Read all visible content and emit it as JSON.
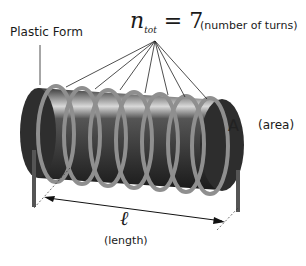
{
  "labels": {
    "form": "Plastic Form",
    "n_symbol": "n",
    "n_subscript": "tot",
    "n_equals": " = 7",
    "turns_note": "(number of turns)",
    "area_symbol": "A",
    "area_note": "(area)",
    "length_symbol": "ℓ",
    "length_note": "(length)"
  },
  "diagram": {
    "turns": 7,
    "colors": {
      "form": "#2a2a2a",
      "wire": "#8a8a8a",
      "lines": "#1a1a1a"
    }
  }
}
